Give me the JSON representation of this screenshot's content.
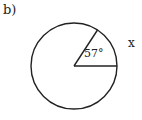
{
  "part_label": "b)",
  "angle_label": "57°",
  "arc_label": "x",
  "diagram": {
    "shape": "circle",
    "center": [
      74,
      66
    ],
    "radius": 43,
    "central_angle_deg": 57,
    "stroke_color": "#222222"
  }
}
